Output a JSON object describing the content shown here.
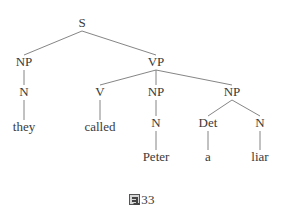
{
  "figure": {
    "type": "syntax-tree",
    "sentence": "they called Peter a liar",
    "caption": {
      "glyph": "missing-glyph-box",
      "number": "33",
      "full_text": "▩ 33"
    },
    "colors": {
      "edge": "#777777",
      "text": "#3a3a3a",
      "background": "#ffffff"
    },
    "nodes": [
      {
        "id": "S",
        "label": "S",
        "x": 82,
        "y": 27,
        "kind": "nonterminal"
      },
      {
        "id": "NP1",
        "label": "NP",
        "x": 24,
        "y": 66,
        "kind": "nonterminal"
      },
      {
        "id": "VP",
        "label": "VP",
        "x": 156,
        "y": 66,
        "kind": "nonterminal"
      },
      {
        "id": "N1",
        "label": "N",
        "x": 24,
        "y": 96,
        "kind": "nonterminal"
      },
      {
        "id": "V",
        "label": "V",
        "x": 100,
        "y": 96,
        "kind": "nonterminal"
      },
      {
        "id": "NP2",
        "label": "NP",
        "x": 156,
        "y": 96,
        "kind": "nonterminal"
      },
      {
        "id": "NP3",
        "label": "NP",
        "x": 232,
        "y": 96,
        "kind": "nonterminal"
      },
      {
        "id": "they",
        "label": "they",
        "x": 24,
        "y": 131,
        "kind": "terminal"
      },
      {
        "id": "called",
        "label": "called",
        "x": 100,
        "y": 131,
        "kind": "terminal"
      },
      {
        "id": "N2",
        "label": "N",
        "x": 156,
        "y": 127,
        "kind": "nonterminal"
      },
      {
        "id": "Det",
        "label": "Det",
        "x": 208,
        "y": 127,
        "kind": "nonterminal"
      },
      {
        "id": "N3",
        "label": "N",
        "x": 260,
        "y": 127,
        "kind": "nonterminal"
      },
      {
        "id": "Peter",
        "label": "Peter",
        "x": 156,
        "y": 161,
        "kind": "terminal"
      },
      {
        "id": "a",
        "label": "a",
        "x": 208,
        "y": 161,
        "kind": "terminal"
      },
      {
        "id": "liar",
        "label": "liar",
        "x": 260,
        "y": 161,
        "kind": "terminal"
      }
    ],
    "edges": [
      {
        "from": "S",
        "to": "NP1"
      },
      {
        "from": "S",
        "to": "VP"
      },
      {
        "from": "NP1",
        "to": "N1"
      },
      {
        "from": "N1",
        "to": "they"
      },
      {
        "from": "VP",
        "to": "V"
      },
      {
        "from": "VP",
        "to": "NP2"
      },
      {
        "from": "VP",
        "to": "NP3"
      },
      {
        "from": "V",
        "to": "called"
      },
      {
        "from": "NP2",
        "to": "N2"
      },
      {
        "from": "N2",
        "to": "Peter"
      },
      {
        "from": "NP3",
        "to": "Det"
      },
      {
        "from": "NP3",
        "to": "N3"
      },
      {
        "from": "Det",
        "to": "a"
      },
      {
        "from": "N3",
        "to": "liar"
      }
    ]
  }
}
